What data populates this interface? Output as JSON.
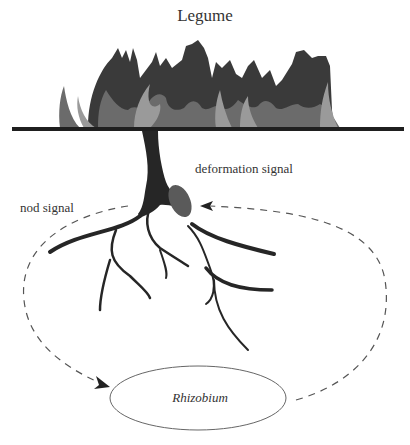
{
  "title": "Legume",
  "labels": {
    "deformation_signal": "deformation signal",
    "nod_signal": "nod signal",
    "rhizobium": "Rhizobium"
  },
  "colors": {
    "foliage_dark": "#3a3a3a",
    "foliage_mid": "#6b6b6b",
    "foliage_light": "#9a9a9a",
    "ground": "#1f1f1f",
    "root": "#262626",
    "nodule": "#5a5a5a",
    "dashed": "#555555"
  }
}
